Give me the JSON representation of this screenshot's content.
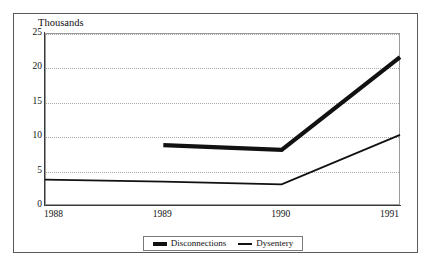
{
  "chart_data": {
    "type": "line",
    "title": "",
    "unit_label": "Thousands",
    "xlabel": "",
    "ylabel": "",
    "x": [
      "1988",
      "1989",
      "1990",
      "1991"
    ],
    "categories": [
      "1988",
      "1989",
      "1990",
      "1991"
    ],
    "ylim": [
      0,
      25
    ],
    "yticks": [
      0,
      5,
      10,
      15,
      20,
      25
    ],
    "ytick_labels": [
      "0",
      "5",
      "10",
      "15",
      "20",
      "25"
    ],
    "grid": "horizontal-dotted",
    "legend_position": "bottom-center",
    "series": [
      {
        "name": "Disconnections",
        "style": "thick",
        "color": "#111111",
        "x": [
          "1989",
          "1990",
          "1991"
        ],
        "values": [
          8.7,
          8.0,
          21.5
        ]
      },
      {
        "name": "Dysentery",
        "style": "thin",
        "color": "#111111",
        "x": [
          "1988",
          "1989",
          "1990",
          "1991"
        ],
        "values": [
          3.7,
          3.4,
          3.0,
          10.2
        ]
      }
    ]
  },
  "legend": {
    "entries": [
      {
        "label": "Disconnections"
      },
      {
        "label": "Dysentery"
      }
    ]
  },
  "colors": {
    "series": "#111111",
    "frame": "#5a5a5a",
    "axis": "#3a3a3a",
    "grid": "#a8a8a8",
    "background": "#ffffff"
  }
}
